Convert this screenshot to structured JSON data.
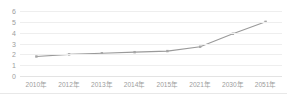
{
  "chart_data": {
    "type": "line",
    "title": "",
    "xlabel": "",
    "ylabel": "",
    "categories": [
      "2010年",
      "2012年",
      "2013年",
      "2014年",
      "2015年",
      "2021年",
      "2030年",
      "2051年"
    ],
    "values": [
      1.8,
      2.0,
      2.1,
      2.2,
      2.3,
      2.7,
      3.9,
      5.0
    ],
    "series": [
      {
        "name": "",
        "values": [
          1.8,
          2.0,
          2.1,
          2.2,
          2.3,
          2.7,
          3.9,
          5.0
        ]
      }
    ],
    "ylim": [
      0,
      6
    ],
    "yticks": [
      0,
      1,
      2,
      3,
      4,
      5,
      6
    ],
    "ytick_labels": [
      "0",
      "1",
      "2",
      "3",
      "4",
      "5",
      "6"
    ],
    "grid": true,
    "grid_axis": "y",
    "legend": false,
    "legend_position": "none",
    "marker": "square",
    "line_color": "#9a9a9a",
    "marker_color": "#a6a6a6",
    "grid_color": "#eeeeee",
    "tick_label_color": "#9d9d9d",
    "background_color": "#ffffff"
  }
}
